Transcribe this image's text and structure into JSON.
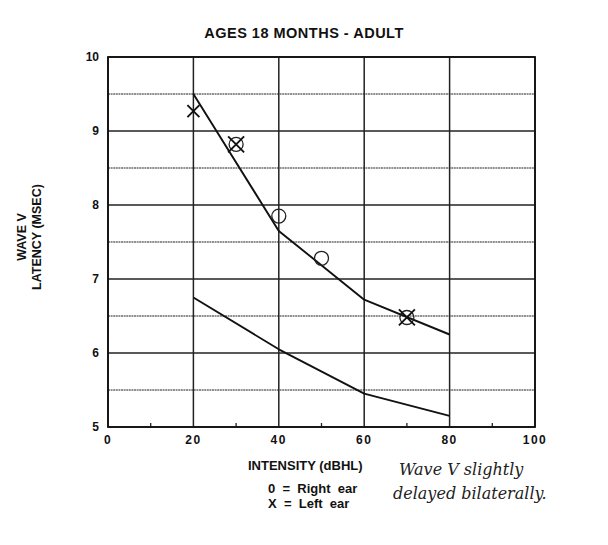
{
  "chart_data": {
    "type": "line",
    "title": "AGES 18 MONTHS - ADULT",
    "xlabel": "INTENSITY (dBHL)",
    "ylabel": [
      "WAVE V",
      "LATENCY (MSEC)"
    ],
    "xlim": [
      0,
      100
    ],
    "ylim": [
      5,
      10
    ],
    "x_ticks": [
      0,
      20,
      40,
      60,
      80,
      100
    ],
    "y_ticks": [
      5,
      6,
      7,
      8,
      9,
      10
    ],
    "grid": true,
    "series": [
      {
        "name": "Upper normal limit",
        "x": [
          20,
          40,
          60,
          80
        ],
        "values": [
          9.5,
          7.65,
          6.72,
          6.25
        ]
      },
      {
        "name": "Lower normal limit",
        "x": [
          20,
          40,
          60,
          80
        ],
        "values": [
          6.75,
          6.05,
          5.45,
          5.15
        ]
      }
    ],
    "points": [
      {
        "ear": "Left",
        "symbol": "X",
        "x": 20,
        "y": 9.27
      },
      {
        "ear": "Both",
        "symbol": "O+X",
        "x": 30,
        "y": 8.82
      },
      {
        "ear": "Right",
        "symbol": "O",
        "x": 40,
        "y": 7.85
      },
      {
        "ear": "Right",
        "symbol": "O",
        "x": 50,
        "y": 7.28
      },
      {
        "ear": "Both",
        "symbol": "O+X",
        "x": 70,
        "y": 6.48
      }
    ],
    "legend": [
      "0 = Right ear",
      "X = Left ear"
    ],
    "annotation": "Wave V slightly delayed bilaterally."
  },
  "title": "AGES 18 MONTHS - ADULT",
  "ylabel_line1": "WAVE V",
  "ylabel_line2": "LATENCY  (MSEC)",
  "xlabel": "INTENSITY  (dBHL)",
  "legend": {
    "right": "0  =  Right  ear",
    "left": "X  =  Left  ear"
  },
  "note": {
    "line1": "Wave Ⅴ slightly",
    "line2": "delayed bilaterally."
  }
}
